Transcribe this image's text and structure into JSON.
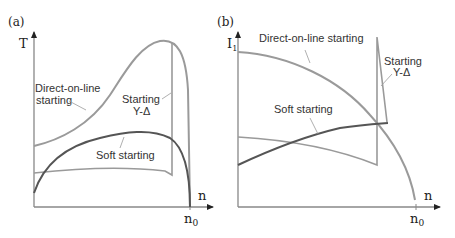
{
  "panels": [
    {
      "id": "a",
      "panel_label": "(a)",
      "y_axis_label": "T",
      "x_axis_label": "n",
      "x_tick_label": "n",
      "x_tick_subscript": "0",
      "curves": [
        {
          "name": "Direct-on-line starting",
          "label_line1": "Direct-on-line",
          "label_line2": "starting",
          "color": "#9a9a9a"
        },
        {
          "name": "Starting Y-Δ",
          "label_line1": "Starting",
          "label_line2": "Y-Δ",
          "color": "#9a9a9a"
        },
        {
          "name": "Soft starting",
          "label_line1": "Soft starting",
          "color": "#555555"
        }
      ]
    },
    {
      "id": "b",
      "panel_label": "(b)",
      "y_axis_label": "I",
      "y_axis_subscript": "1",
      "x_axis_label": "n",
      "x_tick_label": "n",
      "x_tick_subscript": "0",
      "curves": [
        {
          "name": "Direct-on-line starting",
          "label_line1": "Direct-on-line starting",
          "color": "#9a9a9a"
        },
        {
          "name": "Starting Y-Δ",
          "label_line1": "Starting",
          "label_line2": "Y-Δ",
          "color": "#9a9a9a"
        },
        {
          "name": "Soft starting",
          "label_line1": "Soft starting",
          "color": "#555555"
        }
      ]
    }
  ],
  "colors": {
    "axis": "#888888",
    "light_curve": "#9a9a9a",
    "dark_curve": "#555555"
  }
}
